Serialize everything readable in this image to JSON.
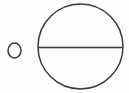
{
  "figure": {
    "canvas": {
      "width": 129,
      "height": 93,
      "background_color": "#fdfdfd"
    },
    "style": {
      "stroke_color": "#3a3a3a",
      "stroke_width": 1.5,
      "fill": "none"
    },
    "shapes": [
      {
        "name": "small-circle",
        "type": "ellipse",
        "cx": 14.5,
        "cy": 50.5,
        "rx": 6.5,
        "ry": 7.5,
        "fill": "none",
        "stroke_color": "#3a3a3a",
        "stroke_width": 1.5
      },
      {
        "name": "large-circle",
        "type": "ellipse",
        "cx": 80.5,
        "cy": 46.5,
        "rx": 42.5,
        "ry": 42.5,
        "fill": "none",
        "stroke_color": "#3a3a3a",
        "stroke_width": 1.5
      },
      {
        "name": "horizontal-diameter-line",
        "type": "line",
        "x1": 38,
        "y1": 47.5,
        "x2": 123,
        "y2": 47.5,
        "stroke_color": "#3a3a3a",
        "stroke_width": 1.5
      }
    ]
  }
}
